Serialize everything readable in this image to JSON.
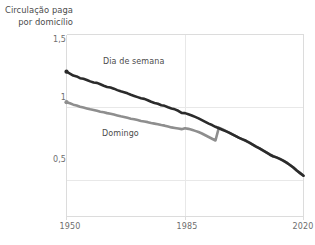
{
  "chart_data": {
    "type": "line",
    "title": "Circulação paga\npor domicílio",
    "xlabel": "",
    "ylabel": "",
    "xlim": [
      1950,
      2020
    ],
    "ylim": [
      0.25,
      1.5
    ],
    "xticks": [
      1950,
      1985,
      2020
    ],
    "xticklabels": [
      "1950",
      "1985",
      "2020"
    ],
    "yticks": [
      0.5,
      1,
      1.5
    ],
    "yticklabels": [
      "0,5",
      "1",
      "1,5"
    ],
    "grid": "horizontal-and-vertical-light",
    "legend_position": "inline-annotations",
    "series": [
      {
        "name": "Dia de semana",
        "color": "#2b2b2b",
        "annotation": "Dia de semana",
        "x": [
          1950,
          1951,
          1952,
          1953,
          1954,
          1955,
          1956,
          1957,
          1958,
          1959,
          1960,
          1961,
          1962,
          1963,
          1964,
          1965,
          1966,
          1967,
          1968,
          1969,
          1970,
          1971,
          1972,
          1973,
          1974,
          1975,
          1976,
          1977,
          1978,
          1979,
          1980,
          1981,
          1982,
          1983,
          1984,
          1985,
          1986,
          1987,
          1988,
          1989,
          1990,
          1991,
          1992,
          1993,
          1994,
          1995,
          1996,
          1997,
          1998,
          1999,
          2000,
          2001,
          2002,
          2003,
          2004,
          2005,
          2006,
          2007,
          2008,
          2009,
          2010,
          2011,
          2012,
          2013,
          2014,
          2015,
          2016,
          2017,
          2018,
          2019,
          2020
        ],
        "y": [
          1.245,
          1.232,
          1.218,
          1.212,
          1.2,
          1.196,
          1.188,
          1.178,
          1.17,
          1.168,
          1.158,
          1.148,
          1.14,
          1.136,
          1.128,
          1.118,
          1.11,
          1.104,
          1.096,
          1.086,
          1.078,
          1.07,
          1.062,
          1.058,
          1.048,
          1.038,
          1.03,
          1.024,
          1.014,
          1.01,
          1.0,
          0.992,
          0.986,
          0.976,
          0.962,
          0.96,
          0.952,
          0.944,
          0.934,
          0.924,
          0.912,
          0.9,
          0.888,
          0.878,
          0.866,
          0.856,
          0.846,
          0.836,
          0.826,
          0.814,
          0.802,
          0.79,
          0.78,
          0.77,
          0.758,
          0.744,
          0.73,
          0.718,
          0.704,
          0.69,
          0.676,
          0.664,
          0.656,
          0.646,
          0.634,
          0.62,
          0.604,
          0.586,
          0.566,
          0.548,
          0.53
        ]
      },
      {
        "name": "Domingo",
        "color": "#8e8e8e",
        "annotation": "Domingo",
        "x": [
          1950,
          1951,
          1952,
          1953,
          1954,
          1955,
          1956,
          1957,
          1958,
          1959,
          1960,
          1961,
          1962,
          1963,
          1964,
          1965,
          1966,
          1967,
          1968,
          1969,
          1970,
          1971,
          1972,
          1973,
          1974,
          1975,
          1976,
          1977,
          1978,
          1979,
          1980,
          1981,
          1982,
          1983,
          1984,
          1985,
          1986,
          1987,
          1988,
          1989,
          1990,
          1991,
          1992,
          1993,
          1994,
          1995,
          1996,
          1997,
          1998,
          1999,
          2000,
          2001,
          2002,
          2003,
          2004,
          2005,
          2006,
          2007,
          2008,
          2009,
          2010,
          2011,
          2012,
          2013,
          2014,
          2015,
          2016,
          2017,
          2018,
          2019,
          2020
        ],
        "y": [
          1.035,
          1.028,
          1.018,
          1.012,
          1.004,
          0.998,
          0.992,
          0.986,
          0.982,
          0.976,
          0.97,
          0.966,
          0.96,
          0.956,
          0.95,
          0.944,
          0.938,
          0.934,
          0.928,
          0.922,
          0.918,
          0.912,
          0.906,
          0.902,
          0.898,
          0.892,
          0.888,
          0.884,
          0.878,
          0.874,
          0.868,
          0.862,
          0.858,
          0.854,
          0.85,
          0.856,
          0.852,
          0.846,
          0.838,
          0.83,
          0.82,
          0.808,
          0.796,
          0.784,
          0.772,
          0.86,
          0.85,
          0.838,
          0.826,
          0.814,
          0.802,
          0.79,
          0.78,
          0.77,
          0.758,
          0.744,
          0.73,
          0.718,
          0.704,
          0.69,
          0.676,
          0.664,
          0.656,
          0.646,
          0.634,
          0.62,
          0.604,
          0.586,
          0.566,
          0.548,
          0.53
        ]
      }
    ]
  },
  "axes": {
    "y_tick_labels": [
      "1,5",
      "1",
      "0,5"
    ],
    "x_tick_labels": [
      "1950",
      "1985",
      "2020"
    ]
  },
  "annotations": {
    "weekday": "Dia de semana",
    "sunday": "Domingo"
  },
  "title_block": {
    "line1": "Circulação paga",
    "line2": "por domicílio",
    "full": "Circulação paga\npor domicílio"
  },
  "colors": {
    "weekday_line": "#2b2b2b",
    "sunday_line": "#8e8e8e",
    "grid": "#e8e8e8",
    "frame": "#dcdcdc",
    "text": "#6e6e6e",
    "title_text": "#4b4b4b",
    "background": "#ffffff"
  }
}
